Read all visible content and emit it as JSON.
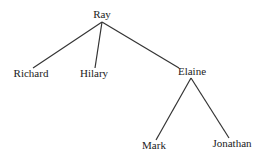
{
  "tree": {
    "root": "Ray",
    "children": [
      "Richard",
      "Hilary",
      "Elaine"
    ],
    "elaine_children": [
      "Mark",
      "Jonathan"
    ]
  },
  "nodes": [
    {
      "label": "Ray",
      "x": 102,
      "y": 9
    },
    {
      "label": "Richard",
      "x": 30,
      "y": 67
    },
    {
      "label": "Hilary",
      "x": 94,
      "y": 67
    },
    {
      "label": "Elaine",
      "x": 191,
      "y": 65
    },
    {
      "label": "Mark",
      "x": 150,
      "y": 140
    },
    {
      "label": "Jonathan",
      "x": 230,
      "y": 137
    }
  ]
}
